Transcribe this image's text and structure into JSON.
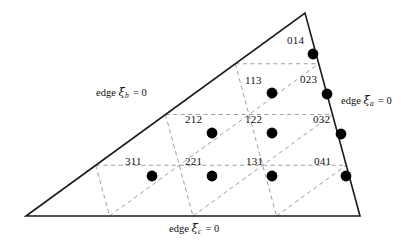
{
  "figure": {
    "type": "diagram",
    "colors": {
      "background": "#ffffff",
      "outline": "#1a1a1a",
      "grid_dashed": "#9a9a9a",
      "node_fill": "#000000",
      "text": "#111111"
    },
    "triangle": {
      "vertices": [
        {
          "name": "bottom-left",
          "x": 26,
          "y": 216
        },
        {
          "name": "apex",
          "x": 305,
          "y": 13
        },
        {
          "name": "bottom-right",
          "x": 360,
          "y": 216
        }
      ],
      "subdivisions": 4,
      "outline_width": 1.6
    },
    "edge_labels": [
      {
        "id": "edge-xi-b",
        "prefix": "edge",
        "symbol": "ξ",
        "subscript": "b",
        "equals": "= 0",
        "x": 96,
        "y": 92
      },
      {
        "id": "edge-xi-a",
        "prefix": "edge",
        "symbol": "ξ",
        "subscript": "a",
        "equals": "= 0",
        "x": 341,
        "y": 100
      },
      {
        "id": "edge-xi-c",
        "prefix": "edge",
        "symbol": "ξ",
        "subscript": "c",
        "equals": "= 0",
        "x": 169,
        "y": 228
      }
    ],
    "nodes": [
      {
        "label": "014",
        "cx": 313,
        "cy": 54,
        "lx": 287,
        "ly": 41
      },
      {
        "label": "113",
        "cx": 272,
        "cy": 93,
        "lx": 245,
        "ly": 81
      },
      {
        "label": "023",
        "cx": 327,
        "cy": 94,
        "lx": 300,
        "ly": 80
      },
      {
        "label": "212",
        "cx": 212,
        "cy": 133,
        "lx": 185,
        "ly": 120
      },
      {
        "label": "122",
        "cx": 272,
        "cy": 133,
        "lx": 245,
        "ly": 120
      },
      {
        "label": "032",
        "cx": 341,
        "cy": 134,
        "lx": 313,
        "ly": 120
      },
      {
        "label": "311",
        "cx": 152,
        "cy": 176,
        "lx": 125,
        "ly": 162
      },
      {
        "label": "221",
        "cx": 212,
        "cy": 176,
        "lx": 185,
        "ly": 162
      },
      {
        "label": "131",
        "cx": 272,
        "cy": 176,
        "lx": 246,
        "ly": 162
      },
      {
        "label": "041",
        "cx": 346,
        "cy": 176,
        "lx": 314,
        "ly": 162
      }
    ]
  }
}
